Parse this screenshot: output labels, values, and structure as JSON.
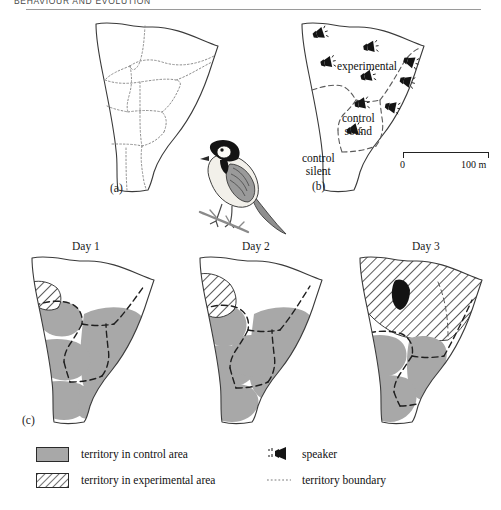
{
  "running_head": {
    "text": "BEHAVIOUR AND EVOLUTION"
  },
  "figure": {
    "panels": [
      {
        "id": "a",
        "label": "(a)"
      },
      {
        "id": "b",
        "label": "(b)"
      },
      {
        "id": "c",
        "label": "(c)"
      }
    ],
    "panel_a": {
      "label": "(a)",
      "description": "woodland-outline-with-dotted-territory-boundaries"
    },
    "panel_b": {
      "label": "(b)",
      "area_labels": [
        {
          "name": "experimental",
          "text": "experimental"
        },
        {
          "name": "control-sound",
          "text": "control\nsound",
          "line1": "control",
          "line2": "sound"
        },
        {
          "name": "control-silent",
          "text": "control\nsilent",
          "line1": "control",
          "line2": "silent"
        }
      ],
      "speaker_count": 9,
      "scalebar": {
        "left_label": "0",
        "right_label": "100 m"
      }
    },
    "panel_c": {
      "label": "(c)",
      "days": [
        {
          "day": "Day 1",
          "experimental_extent": "small"
        },
        {
          "day": "Day 2",
          "experimental_extent": "medium"
        },
        {
          "day": "Day 3",
          "experimental_extent": "large"
        }
      ]
    },
    "bird": {
      "name": "great-tit-illustration"
    }
  },
  "legend": {
    "entries": [
      {
        "icon": "grey-swatch",
        "label": "territory in control area"
      },
      {
        "icon": "hatched-swatch",
        "label": "territory in experimental area"
      },
      {
        "icon": "speaker-icon",
        "label": "speaker"
      },
      {
        "icon": "dotted-line",
        "label": "territory boundary"
      }
    ]
  },
  "colors": {
    "control_fill": "#a8a8a8",
    "outline": "#222222",
    "boundary": "#555555",
    "dark_patch": "#111111",
    "paper": "#ffffff"
  }
}
